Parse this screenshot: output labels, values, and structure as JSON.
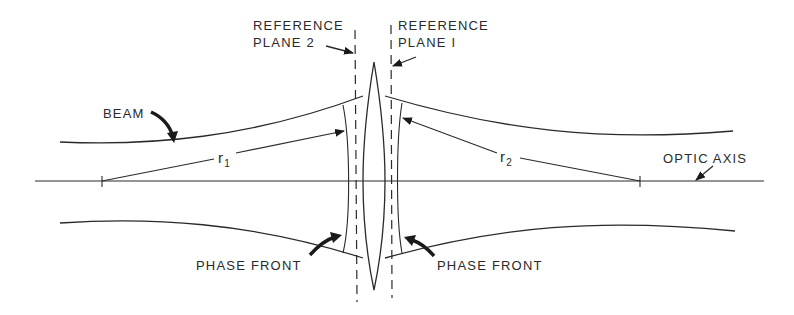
{
  "diagram": {
    "labels": {
      "reference_plane_2": [
        "REFERENCE",
        "PLANE 2"
      ],
      "reference_plane_1": [
        "REFERENCE",
        "PLANE I"
      ],
      "beam": "BEAM",
      "optic_axis": "OPTIC AXIS",
      "phase_front_left": "PHASE FRONT",
      "phase_front_right": "PHASE FRONT",
      "r1": {
        "main": "r",
        "sub": "1"
      },
      "r2": {
        "main": "r",
        "sub": "2"
      }
    },
    "colors": {
      "line": "#2a2a2a",
      "background": "#ffffff"
    }
  }
}
